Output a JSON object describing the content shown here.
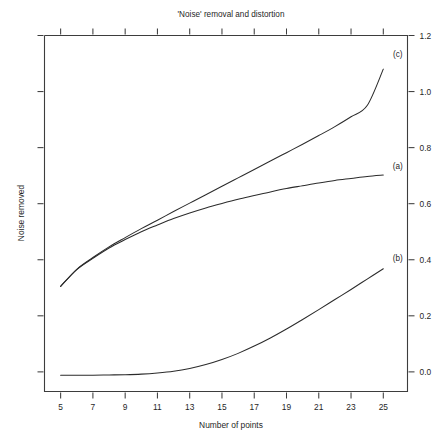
{
  "chart_data": {
    "type": "line",
    "title": "'Noise' removal and distortion",
    "xlabel": "Number of points",
    "ylabel": "Noise removed",
    "xlim": [
      4,
      26.5
    ],
    "ylim": [
      -0.07,
      1.2
    ],
    "grid": false,
    "legend_position": "inline-right-of-curve-ends",
    "x_ticks": [
      5,
      7,
      9,
      11,
      13,
      15,
      17,
      19,
      21,
      23,
      25
    ],
    "x_tick_labels": [
      "5",
      "7",
      "9",
      "11",
      "13",
      "15",
      "17",
      "19",
      "21",
      "23",
      "25"
    ],
    "y_ticks": [
      0.0,
      0.2,
      0.4,
      0.6,
      0.8,
      1.0,
      1.2
    ],
    "y_tick_labels": [
      "0.0",
      "0.2",
      "0.4",
      "0.6",
      "0.8",
      "1.0",
      "1.2"
    ],
    "y_axis_side": "right",
    "x": [
      5,
      6,
      7,
      8,
      9,
      10,
      11,
      12,
      13,
      14,
      15,
      16,
      17,
      18,
      19,
      20,
      21,
      22,
      23,
      24,
      25
    ],
    "series": [
      {
        "name": "(a)",
        "label": "(a)",
        "label_x": 25.9,
        "label_y": 0.735,
        "values": [
          0.305,
          0.365,
          0.405,
          0.442,
          0.472,
          0.5,
          0.524,
          0.547,
          0.567,
          0.585,
          0.601,
          0.616,
          0.629,
          0.642,
          0.654,
          0.664,
          0.674,
          0.683,
          0.69,
          0.697,
          0.702
        ]
      },
      {
        "name": "(b)",
        "label": "(b)",
        "label_x": 25.9,
        "label_y": 0.408,
        "values": [
          -0.012,
          -0.012,
          -0.012,
          -0.011,
          -0.01,
          -0.008,
          -0.004,
          0.002,
          0.012,
          0.026,
          0.044,
          0.066,
          0.092,
          0.121,
          0.153,
          0.187,
          0.222,
          0.258,
          0.294,
          0.331,
          0.368
        ]
      },
      {
        "name": "(c)",
        "label": "(c)",
        "label_x": 25.9,
        "label_y": 1.135,
        "values": [
          0.305,
          0.366,
          0.408,
          0.446,
          0.479,
          0.511,
          0.541,
          0.572,
          0.602,
          0.632,
          0.662,
          0.692,
          0.722,
          0.752,
          0.782,
          0.812,
          0.843,
          0.875,
          0.91,
          0.95,
          1.08
        ]
      }
    ]
  },
  "colors": {
    "axis": "#3d3d3d",
    "curve": "#2b2b2b",
    "text": "#1f1f1f",
    "background": "#ffffff"
  }
}
